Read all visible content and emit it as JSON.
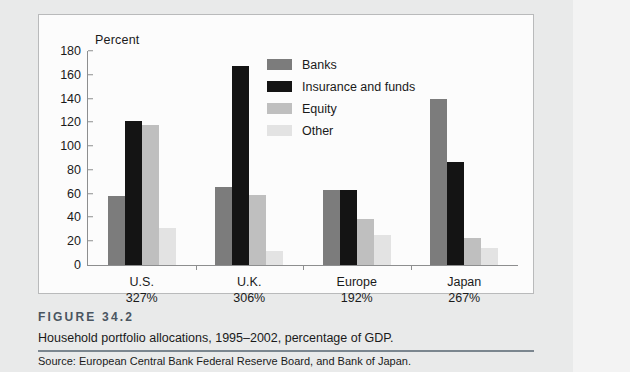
{
  "figure": {
    "number": "FIGURE  34.2",
    "caption": "Household portfolio allocations, 1995–2002, percentage of GDP.",
    "source": "Source: European Central Bank Federal Reserve Board, and Bank of Japan."
  },
  "chart_data": {
    "type": "bar",
    "title": "",
    "xlabel": "",
    "ylabel": "Percent",
    "ylim": [
      0,
      180
    ],
    "yticks": [
      0,
      20,
      40,
      60,
      80,
      100,
      120,
      140,
      160,
      180
    ],
    "grid": false,
    "legend_position": "inside-top-center",
    "categories": [
      "U.S.",
      "U.K.",
      "Europe",
      "Japan"
    ],
    "category_sublabels": [
      "327%",
      "306%",
      "192%",
      "267%"
    ],
    "series": [
      {
        "name": "Banks",
        "color": "#7c7c7c",
        "values": [
          58,
          66,
          63,
          140
        ]
      },
      {
        "name": "Insurance and funds",
        "color": "#141414",
        "values": [
          121,
          167,
          63,
          87
        ]
      },
      {
        "name": "Equity",
        "color": "#bfbfbf",
        "values": [
          118,
          59,
          39,
          23
        ]
      },
      {
        "name": "Other",
        "color": "#e3e3e3",
        "values": [
          31,
          12,
          25,
          14
        ]
      }
    ]
  },
  "colors": {
    "banks": "#7c7c7c",
    "insurance": "#141414",
    "equity": "#bfbfbf",
    "other": "#e3e3e3",
    "axis": "#8d8e8f",
    "rule": "#7b868f",
    "fig_number": "#4a5560"
  }
}
